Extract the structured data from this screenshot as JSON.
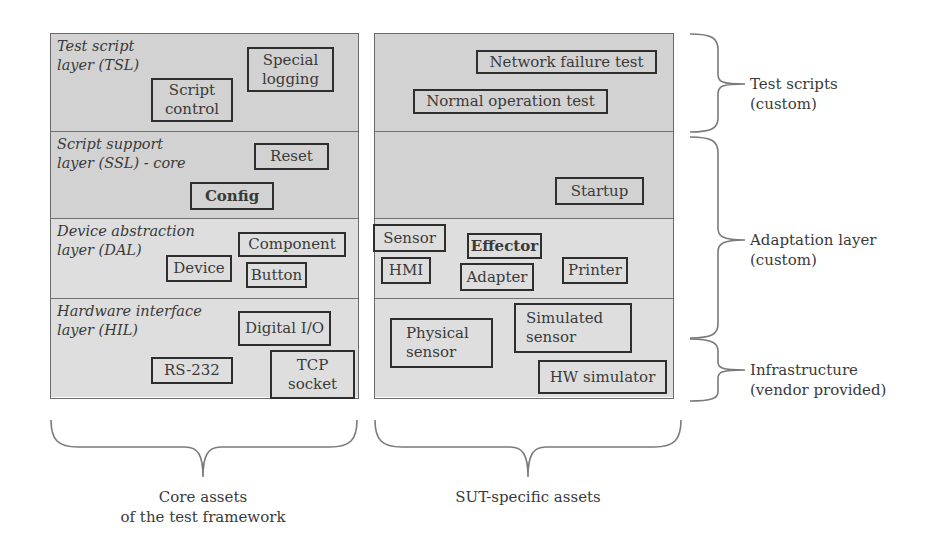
{
  "core_panel": {
    "layers": [
      {
        "id": "tsl",
        "label": "Test script\nlayer (TSL)",
        "shade": "dark"
      },
      {
        "id": "ssl",
        "label": "Script support\nlayer (SSL) - core",
        "shade": "dark"
      },
      {
        "id": "dal",
        "label": "Device abstraction\nlayer (DAL)",
        "shade": "light"
      },
      {
        "id": "hil",
        "label": "Hardware interface\nlayer (HIL)",
        "shade": "light"
      }
    ],
    "boxes": {
      "script_control": "Script\ncontrol",
      "special_logging": "Special\nlogging",
      "reset": "Reset",
      "config": "Config",
      "component": "Component",
      "device": "Device",
      "button": "Button",
      "digital_io": "Digital I/O",
      "rs232": "RS-232",
      "tcp_socket": "TCP\nsocket"
    }
  },
  "sut_panel": {
    "boxes": {
      "network_failure_test": "Network failure test",
      "normal_operation_test": "Normal operation test",
      "startup": "Startup",
      "sensor": "Sensor",
      "effector": "Effector",
      "hmi": "HMI",
      "adapter": "Adapter",
      "printer": "Printer",
      "physical_sensor": "Physical\nsensor",
      "simulated_sensor": "Simulated\nsensor",
      "hw_simulator": "HW simulator"
    }
  },
  "right_labels": {
    "test_scripts": "Test scripts\n(custom)",
    "adaptation_layer": "Adaptation layer\n(custom)",
    "infrastructure": "Infrastructure\n(vendor provided)"
  },
  "bottom_labels": {
    "core_assets": "Core assets\nof the test framework",
    "sut_assets": "SUT-specific assets"
  },
  "colors": {
    "dark_layer": "#d2d2d2",
    "light_layer": "#dedede",
    "box_border": "#2e2e2e",
    "brace": "#7a7a7a"
  }
}
